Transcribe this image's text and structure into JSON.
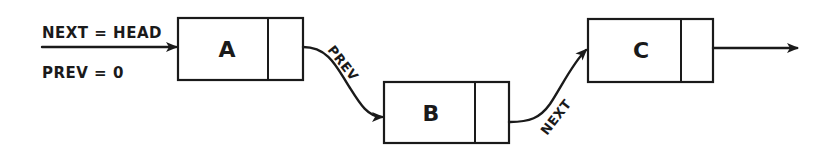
{
  "diagram": {
    "type": "doubly-linked-list",
    "annotations": {
      "next": "NEXT = HEAD",
      "prev": "PREV = 0"
    },
    "nodes": [
      {
        "id": "A",
        "label": "A"
      },
      {
        "id": "B",
        "label": "B"
      },
      {
        "id": "C",
        "label": "C"
      }
    ],
    "links": [
      {
        "from": "A",
        "to": "B",
        "label": "PREV"
      },
      {
        "from": "B",
        "to": "C",
        "label": "NEXT"
      }
    ],
    "colors": {
      "ink": "#1a1a1a",
      "background": "#ffffff"
    }
  }
}
